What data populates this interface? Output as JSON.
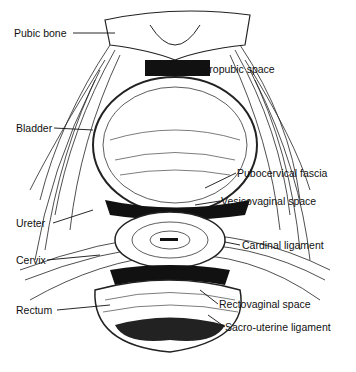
{
  "figure": {
    "labels": {
      "pubic_bone": "Pubic bone",
      "retropubic_space": "Retropubic space",
      "bladder": "Bladder",
      "pubocervical_fascia": "Pubocervical fascia",
      "vesicovaginal_space": "Vesicovaginal space",
      "ureter": "Ureter",
      "cardinal_ligament": "Cardinal ligament",
      "cervix": "Cervix",
      "rectum": "Rectum",
      "rectovaginal_space": "Rectovaginal space",
      "sacro_uterine_ligament": "Sacro-uterine ligament"
    }
  }
}
